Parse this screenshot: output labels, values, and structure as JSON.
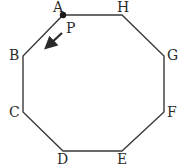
{
  "diagram": {
    "type": "regular-octagon",
    "stroke_color": "#3a3a3a",
    "vertices": [
      {
        "label": "A",
        "x": 63,
        "y": 15
      },
      {
        "label": "H",
        "x": 122,
        "y": 15
      },
      {
        "label": "G",
        "x": 164,
        "y": 56
      },
      {
        "label": "F",
        "x": 164,
        "y": 112
      },
      {
        "label": "E",
        "x": 122,
        "y": 151
      },
      {
        "label": "D",
        "x": 63,
        "y": 151
      },
      {
        "label": "C",
        "x": 23,
        "y": 112
      },
      {
        "label": "B",
        "x": 23,
        "y": 56
      }
    ],
    "labels": {
      "A": "A",
      "H": "H",
      "G": "G",
      "F": "F",
      "E": "E",
      "D": "D",
      "C": "C",
      "B": "B",
      "P": "P"
    },
    "point": {
      "label": "A",
      "marker": "filled-dot"
    },
    "moving_point": {
      "label": "P",
      "direction": "toward B (counter-clockwise along A→B)"
    }
  }
}
